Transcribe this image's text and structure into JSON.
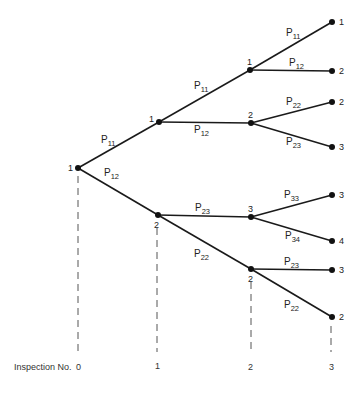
{
  "diagram": {
    "type": "probability-tree",
    "axis": {
      "label": "Inspection No.",
      "ticks": [
        "0",
        "1",
        "2",
        "3"
      ]
    },
    "nodes": [
      {
        "id": "root",
        "state": "1",
        "level": 0
      },
      {
        "id": "n1a",
        "state": "1",
        "level": 1
      },
      {
        "id": "n1b",
        "state": "2",
        "level": 1
      },
      {
        "id": "n2a",
        "state": "1",
        "level": 2
      },
      {
        "id": "n2b",
        "state": "2",
        "level": 2
      },
      {
        "id": "n2c",
        "state": "3",
        "level": 2
      },
      {
        "id": "n2d",
        "state": "2",
        "level": 2
      },
      {
        "id": "n3a",
        "state": "1",
        "level": 3
      },
      {
        "id": "n3b",
        "state": "2",
        "level": 3
      },
      {
        "id": "n3c",
        "state": "2",
        "level": 3
      },
      {
        "id": "n3d",
        "state": "3",
        "level": 3
      },
      {
        "id": "n3e",
        "state": "3",
        "level": 3
      },
      {
        "id": "n3f",
        "state": "4",
        "level": 3
      },
      {
        "id": "n3g",
        "state": "3",
        "level": 3
      },
      {
        "id": "n3h",
        "state": "2",
        "level": 3
      }
    ],
    "edges": [
      {
        "from": "root",
        "to": "n1a",
        "p": "P",
        "sub": "11"
      },
      {
        "from": "root",
        "to": "n1b",
        "p": "P",
        "sub": "12"
      },
      {
        "from": "n1a",
        "to": "n2a",
        "p": "P",
        "sub": "11"
      },
      {
        "from": "n1a",
        "to": "n2b",
        "p": "P",
        "sub": "12"
      },
      {
        "from": "n1b",
        "to": "n2c",
        "p": "P",
        "sub": "23"
      },
      {
        "from": "n1b",
        "to": "n2d",
        "p": "P",
        "sub": "22"
      },
      {
        "from": "n2a",
        "to": "n3a",
        "p": "P",
        "sub": "11"
      },
      {
        "from": "n2a",
        "to": "n3b",
        "p": "P",
        "sub": "12"
      },
      {
        "from": "n2b",
        "to": "n3c",
        "p": "P",
        "sub": "22"
      },
      {
        "from": "n2b",
        "to": "n3d",
        "p": "P",
        "sub": "23"
      },
      {
        "from": "n2c",
        "to": "n3e",
        "p": "P",
        "sub": "33"
      },
      {
        "from": "n2c",
        "to": "n3f",
        "p": "P",
        "sub": "34"
      },
      {
        "from": "n2d",
        "to": "n3g",
        "p": "P",
        "sub": "23"
      },
      {
        "from": "n2d",
        "to": "n3h",
        "p": "P",
        "sub": "22"
      }
    ]
  }
}
